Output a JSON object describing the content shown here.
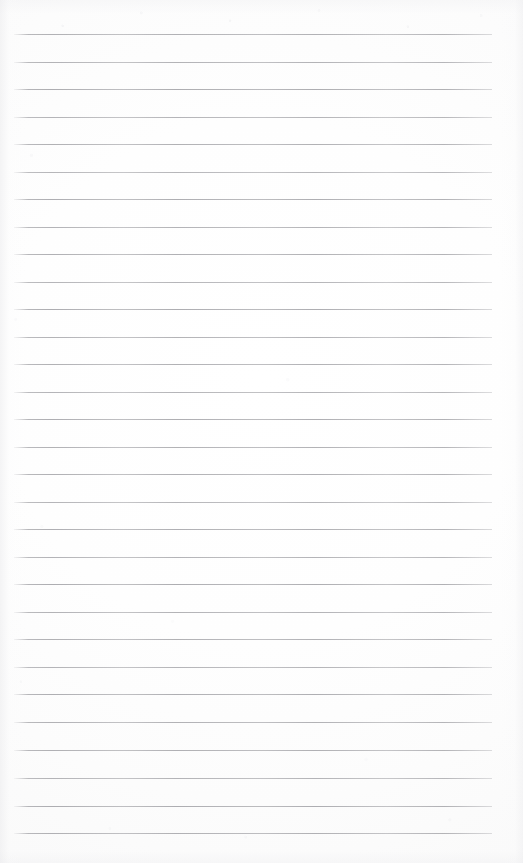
{
  "document": {
    "type": "scanned-ruled-notebook-page",
    "title": "Blank lined notebook page",
    "width": 523,
    "height": 863,
    "background_color": "#fefefe",
    "edge_tint_color": "#f2f2f3",
    "text_content": "",
    "annotations": [],
    "handwriting": "",
    "printed_text": ""
  },
  "ruling": {
    "line_color": "#a9a9ad",
    "line_thickness": 1,
    "line_count": 30,
    "line_spacing": 27.55,
    "first_line_y": 34,
    "last_line_y": 833,
    "left_margin_x": 14,
    "right_margin_x": 492,
    "line_length": 478,
    "margin_rule": "none",
    "lines": [
      {
        "index": 1,
        "y": 34,
        "x1": 14,
        "x2": 492,
        "opacity": 0.92
      },
      {
        "index": 2,
        "y": 62,
        "x1": 14,
        "x2": 492,
        "opacity": 0.88
      },
      {
        "index": 3,
        "y": 89,
        "x1": 14,
        "x2": 492,
        "opacity": 0.95
      },
      {
        "index": 4,
        "y": 117,
        "x1": 14,
        "x2": 492,
        "opacity": 0.86
      },
      {
        "index": 5,
        "y": 144,
        "x1": 14,
        "x2": 492,
        "opacity": 0.9
      },
      {
        "index": 6,
        "y": 172,
        "x1": 14,
        "x2": 492,
        "opacity": 0.84
      },
      {
        "index": 7,
        "y": 199,
        "x1": 14,
        "x2": 492,
        "opacity": 0.93
      },
      {
        "index": 8,
        "y": 227,
        "x1": 14,
        "x2": 492,
        "opacity": 0.87
      },
      {
        "index": 9,
        "y": 254,
        "x1": 14,
        "x2": 492,
        "opacity": 0.91
      },
      {
        "index": 10,
        "y": 282,
        "x1": 14,
        "x2": 492,
        "opacity": 0.85
      },
      {
        "index": 11,
        "y": 309,
        "x1": 14,
        "x2": 492,
        "opacity": 0.94
      },
      {
        "index": 12,
        "y": 337,
        "x1": 14,
        "x2": 492,
        "opacity": 0.88
      },
      {
        "index": 13,
        "y": 364,
        "x1": 14,
        "x2": 492,
        "opacity": 0.9
      },
      {
        "index": 14,
        "y": 392,
        "x1": 14,
        "x2": 492,
        "opacity": 0.86
      },
      {
        "index": 15,
        "y": 419,
        "x1": 14,
        "x2": 492,
        "opacity": 0.93
      },
      {
        "index": 16,
        "y": 447,
        "x1": 14,
        "x2": 492,
        "opacity": 0.89
      },
      {
        "index": 17,
        "y": 474,
        "x1": 14,
        "x2": 492,
        "opacity": 0.91
      },
      {
        "index": 18,
        "y": 502,
        "x1": 14,
        "x2": 492,
        "opacity": 0.85
      },
      {
        "index": 19,
        "y": 529,
        "x1": 14,
        "x2": 492,
        "opacity": 0.92
      },
      {
        "index": 20,
        "y": 557,
        "x1": 14,
        "x2": 492,
        "opacity": 0.87
      },
      {
        "index": 21,
        "y": 584,
        "x1": 14,
        "x2": 492,
        "opacity": 0.94
      },
      {
        "index": 22,
        "y": 612,
        "x1": 14,
        "x2": 492,
        "opacity": 0.88
      },
      {
        "index": 23,
        "y": 639,
        "x1": 14,
        "x2": 492,
        "opacity": 0.9
      },
      {
        "index": 24,
        "y": 667,
        "x1": 14,
        "x2": 492,
        "opacity": 0.86
      },
      {
        "index": 25,
        "y": 694,
        "x1": 14,
        "x2": 492,
        "opacity": 0.93
      },
      {
        "index": 26,
        "y": 722,
        "x1": 14,
        "x2": 492,
        "opacity": 0.89
      },
      {
        "index": 27,
        "y": 750,
        "x1": 14,
        "x2": 492,
        "opacity": 0.91
      },
      {
        "index": 28,
        "y": 778,
        "x1": 14,
        "x2": 492,
        "opacity": 0.87
      },
      {
        "index": 29,
        "y": 806,
        "x1": 14,
        "x2": 492,
        "opacity": 0.94
      },
      {
        "index": 30,
        "y": 833,
        "x1": 14,
        "x2": 492,
        "opacity": 0.96
      }
    ]
  }
}
